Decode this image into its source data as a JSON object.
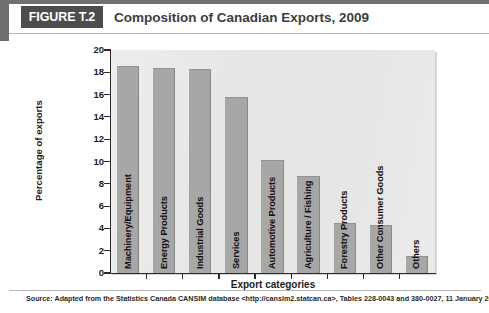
{
  "header": {
    "figure_tag": "FIGURE T.2",
    "title": "Composition of Canadian Exports, 2009"
  },
  "footer": {
    "source": "Source: Adapted from the Statistics Canada CANSIM database <http://cansim2.statcan.ca>, Tables 228-0043 and 380-0027, 11 January 2011."
  },
  "colors": {
    "tag_background": "#4d4d4d",
    "header_rule": "#6f6f6f",
    "plot_background": "#e6e6e4",
    "bar_fill": "#a7a7a5",
    "axis": "#2b2b2b",
    "text": "#1c1c1c"
  },
  "chart_data": {
    "type": "bar",
    "title": "Composition of Canadian Exports, 2009",
    "xlabel": "Export categories",
    "ylabel": "Percentage of exports",
    "ylim": [
      0,
      20
    ],
    "ytick_step": 2,
    "yticks": [
      0,
      2,
      4,
      6,
      8,
      10,
      12,
      14,
      16,
      18,
      20
    ],
    "grid": false,
    "legend": null,
    "categories": [
      "Machinery/Equipment",
      "Energy Products",
      "Industrial Goods",
      "Services",
      "Automotive Products",
      "Agriculture / Fishing",
      "Forestry Products",
      "Other Consumer Goods",
      "Others"
    ],
    "values": [
      18.6,
      18.4,
      18.3,
      15.8,
      10.1,
      8.7,
      4.5,
      4.3,
      1.5
    ]
  }
}
